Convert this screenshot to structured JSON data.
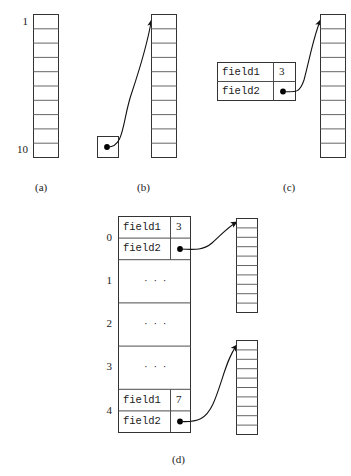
{
  "figure": {
    "stroke_color": "#4d4d4d",
    "outer_stroke_color": "#333333",
    "text_color": "#1a1a1a",
    "background": "#ffffff",
    "panels": [
      {
        "id": "a",
        "caption": "(a)",
        "caption_x": 35,
        "caption_y": 189,
        "description": "A bare array of 10 cells labelled 1 at the top and 10 at the bottom.",
        "array": {
          "x": 33,
          "y": 14,
          "width": 25,
          "height": 143,
          "cells": 10
        },
        "labels": [
          {
            "name": "array-index-top",
            "text": "1",
            "x": 14,
            "y": 21
          },
          {
            "name": "array-index-bottom",
            "text": "10",
            "x": 9,
            "y": 149
          }
        ]
      },
      {
        "id": "b",
        "caption": "(b)",
        "caption_x": 137,
        "caption_y": 189,
        "description": "A single pointer cell whose arrow curves up to the first cell of a 10-cell array.",
        "pointer_box": {
          "x": 97,
          "y": 136,
          "width": 21,
          "height": 21,
          "dot_x": 107,
          "dot_y": 146
        },
        "array": {
          "x": 151,
          "y": 14,
          "width": 25,
          "height": 143,
          "cells": 10
        },
        "arrow": {
          "from_x": 107,
          "from_y": 146,
          "to_x": 152,
          "to_y": 18
        }
      },
      {
        "id": "c",
        "caption": "(c)",
        "caption_x": 283,
        "caption_y": 189,
        "description": "A two-field struct: field1 holds 3, field2 holds a pointer into a 10-cell array.",
        "struct": {
          "x": 217,
          "y": 62,
          "width": 78,
          "height": 38,
          "name_col_width": 56,
          "rows": [
            {
              "field": "field1",
              "value": "3",
              "kind": "scalar"
            },
            {
              "field": "field2",
              "value": "",
              "kind": "pointer"
            }
          ]
        },
        "array": {
          "x": 320,
          "y": 14,
          "width": 25,
          "height": 143,
          "cells": 10
        },
        "arrow": {
          "from_x": 283,
          "from_y": 91,
          "to_x": 321,
          "to_y": 18
        }
      },
      {
        "id": "d",
        "caption": "(d)",
        "caption_x": 172,
        "caption_y": 461,
        "description": "An array of 5 structs, indices 0 through 4. Slot 0 and slot 4 are expanded into field1/field2 rows; slots 1, 2 and 3 are elided with ellipses. field2 of slot 0 and slot 4 each point to a separate 10-cell array.",
        "struct_array": {
          "x": 118,
          "y": 216,
          "width": 72,
          "height": 216,
          "name_col_width": 52,
          "slots": [
            {
              "index": "0",
              "kind": "expanded",
              "rows": [
                {
                  "field": "field1",
                  "value": "3",
                  "kind": "scalar"
                },
                {
                  "field": "field2",
                  "value": "",
                  "kind": "pointer"
                }
              ]
            },
            {
              "index": "1",
              "kind": "elided",
              "ellipsis": "· · ·"
            },
            {
              "index": "2",
              "kind": "elided",
              "ellipsis": "· · ·"
            },
            {
              "index": "3",
              "kind": "elided",
              "ellipsis": "· · ·"
            },
            {
              "index": "4",
              "kind": "expanded",
              "rows": [
                {
                  "field": "field1",
                  "value": "7",
                  "kind": "scalar"
                },
                {
                  "field": "field2",
                  "value": "",
                  "kind": "pointer"
                }
              ]
            }
          ]
        },
        "target_arrays": [
          {
            "name": "target-array-slot-0",
            "x": 236,
            "y": 218,
            "width": 21,
            "height": 94,
            "cells": 10
          },
          {
            "name": "target-array-slot-4",
            "x": 236,
            "y": 340,
            "width": 21,
            "height": 94,
            "cells": 10
          }
        ],
        "arrows": [
          {
            "name": "pointer-arrow-slot-0",
            "from_x": 180,
            "from_y": 251,
            "to_x": 237,
            "to_y": 222
          },
          {
            "name": "pointer-arrow-slot-4",
            "from_x": 180,
            "from_y": 421,
            "to_x": 237,
            "to_y": 345
          }
        ]
      }
    ]
  }
}
